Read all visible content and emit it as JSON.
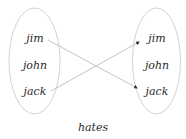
{
  "diagram": {
    "type": "relation-mapping",
    "relation_label": "hates",
    "colors": {
      "outline": "#d2d2d2",
      "edge": "#c4c4c4",
      "arrowhead": "#333333",
      "text": "#2a2a2a"
    },
    "domain": {
      "elements": [
        "jim",
        "john",
        "jack"
      ]
    },
    "codomain": {
      "elements": [
        "jim",
        "john",
        "jack"
      ]
    },
    "mappings": [
      {
        "from": "jim",
        "to": "jack"
      },
      {
        "from": "jack",
        "to": "jim"
      }
    ]
  }
}
